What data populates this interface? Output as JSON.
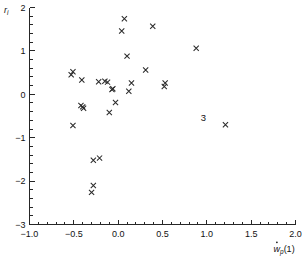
{
  "chart_data": {
    "type": "scatter",
    "title": "",
    "xlabel": "ẇp(1)",
    "ylabel": "ri",
    "xlim": [
      -1.0,
      2.0
    ],
    "ylim": [
      -3.0,
      2.0
    ],
    "grid": false,
    "legend": "none",
    "marker": "x",
    "marker_color": "#2b2b2b",
    "xticks": [
      -1.0,
      -0.5,
      0.0,
      0.5,
      1.0,
      1.5,
      2.0
    ],
    "xticklabels": [
      "−1.0",
      "−0.5",
      "0.0",
      "0.5",
      "1.0",
      "1.5",
      "2.0"
    ],
    "yticks": [
      -3,
      -2,
      -1,
      0,
      1,
      2
    ],
    "yticklabels": [
      "−3",
      "−2",
      "−1",
      "0",
      "1",
      "2"
    ],
    "x_minor_tick_interval": 0.1,
    "y_minor_tick_interval": 0.2,
    "points": [
      {
        "x": -0.53,
        "y": 0.45
      },
      {
        "x": -0.51,
        "y": 0.52
      },
      {
        "x": -0.41,
        "y": 0.33
      },
      {
        "x": -0.51,
        "y": -0.72
      },
      {
        "x": -0.42,
        "y": -0.26
      },
      {
        "x": -0.4,
        "y": -0.29
      },
      {
        "x": -0.39,
        "y": -0.32
      },
      {
        "x": -0.3,
        "y": -2.26
      },
      {
        "x": -0.28,
        "y": -2.1
      },
      {
        "x": -0.28,
        "y": -1.52
      },
      {
        "x": -0.21,
        "y": -1.47
      },
      {
        "x": -0.22,
        "y": 0.29
      },
      {
        "x": -0.15,
        "y": 0.3
      },
      {
        "x": -0.12,
        "y": 0.28
      },
      {
        "x": -0.1,
        "y": -0.42
      },
      {
        "x": -0.07,
        "y": 0.11
      },
      {
        "x": -0.06,
        "y": 0.13
      },
      {
        "x": -0.03,
        "y": -0.19
      },
      {
        "x": 0.04,
        "y": 1.46
      },
      {
        "x": 0.07,
        "y": 1.74
      },
      {
        "x": 0.1,
        "y": 0.88
      },
      {
        "x": 0.12,
        "y": 0.07
      },
      {
        "x": 0.15,
        "y": 0.26
      },
      {
        "x": 0.31,
        "y": 0.56
      },
      {
        "x": 0.39,
        "y": 1.57
      },
      {
        "x": 0.52,
        "y": 0.18
      },
      {
        "x": 0.53,
        "y": 0.26
      },
      {
        "x": 0.88,
        "y": 1.06
      },
      {
        "x": 1.21,
        "y": -0.7
      }
    ],
    "annotations": [
      {
        "label": "3",
        "x": 1.21,
        "y": -0.7,
        "dx": -22,
        "dy": -4
      }
    ]
  },
  "axis_titles": {
    "y_main": "r",
    "y_sub": "i",
    "x_main": "w",
    "x_sub": "p",
    "x_paren": "(1)"
  }
}
